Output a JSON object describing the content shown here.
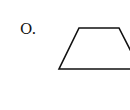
{
  "figure": {
    "label": "O.",
    "shape": {
      "type": "trapezoid",
      "points": [
        [
          79,
          28
        ],
        [
          119,
          28
        ],
        [
          140,
          69
        ],
        [
          59,
          69
        ]
      ],
      "stroke": "#111111",
      "stroke_width": 1.6
    }
  }
}
